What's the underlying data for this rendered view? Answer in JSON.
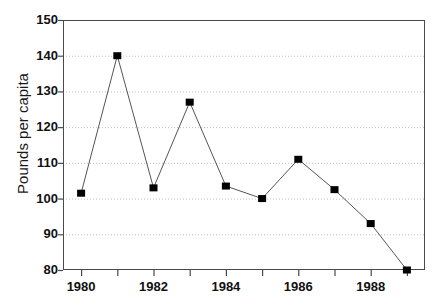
{
  "chart_data": {
    "type": "line",
    "title": "",
    "xlabel": "",
    "ylabel": "Pounds per capita",
    "x": [
      1980,
      1981,
      1982,
      1983,
      1984,
      1985,
      1986,
      1987,
      1988,
      1989
    ],
    "values": [
      101.5,
      140,
      103,
      127,
      103.5,
      100,
      111,
      102.5,
      93,
      80
    ],
    "series": [
      {
        "name": "Pounds per capita",
        "values": [
          101.5,
          140,
          103,
          127,
          103.5,
          100,
          111,
          102.5,
          93,
          80
        ]
      }
    ],
    "xlim": [
      1979.5,
      1989.5
    ],
    "ylim": [
      80,
      150
    ],
    "y_ticks": [
      80,
      90,
      100,
      110,
      120,
      130,
      140,
      150
    ],
    "y_tick_labels": [
      "80",
      "90",
      "100",
      "110",
      "120",
      "130",
      "140",
      "150"
    ],
    "x_ticks": [
      1980,
      1982,
      1984,
      1986,
      1988
    ],
    "x_tick_labels": [
      "1980",
      "1982",
      "1984",
      "1986",
      "1988"
    ],
    "x_minor_ticks": [
      1981,
      1983,
      1985,
      1987,
      1989
    ],
    "grid": true,
    "grid_axis": "y",
    "grid_style": "dotted",
    "legend": false,
    "legend_position": "none",
    "marker": "square",
    "marker_color": "#000000",
    "line_color": "#555555",
    "grid_color": "#bfbfbf",
    "axis_color": "#4a4a4a",
    "background": "#ffffff"
  }
}
